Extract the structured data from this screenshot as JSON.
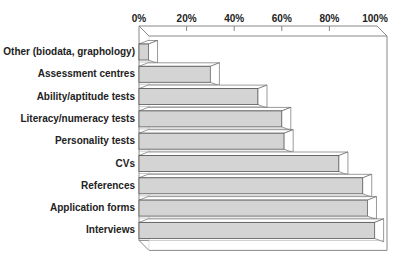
{
  "chart_data": {
    "type": "bar",
    "orientation": "horizontal",
    "style": "3d",
    "title": "",
    "xlabel": "",
    "ylabel": "",
    "xlim": [
      0,
      100
    ],
    "x_ticks": [
      "0%",
      "20%",
      "40%",
      "60%",
      "80%",
      "100%"
    ],
    "grid": false,
    "legend": null,
    "categories": [
      "Other (biodata, graphology)",
      "Assessment centres",
      "Ability/aptitude tests",
      "Literacy/numeracy tests",
      "Personality tests",
      "CVs",
      "References",
      "Application forms",
      "Interviews"
    ],
    "values": [
      4,
      30,
      50,
      60,
      61,
      84,
      94,
      96,
      99
    ],
    "unit": "%",
    "colors": {
      "bar_front": "#d4d4d4",
      "bar_top": "#ffffff",
      "bar_side": "#ffffff",
      "edge": "#555555",
      "frame": "#888888"
    }
  }
}
